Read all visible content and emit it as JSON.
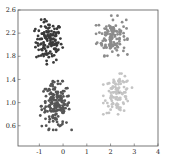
{
  "chart_data": {
    "type": "scatter",
    "title": "",
    "xlabel": "",
    "ylabel": "",
    "xlim": [
      -1.9,
      4.0
    ],
    "ylim": [
      0.25,
      2.6
    ],
    "grid": false,
    "legend": null,
    "x_ticks": [
      -1,
      0,
      1,
      2,
      3,
      4
    ],
    "x_tick_labels": [
      "-1",
      "0",
      "1",
      "2",
      "3",
      "4"
    ],
    "y_ticks": [
      0.6,
      1.0,
      1.4,
      1.8,
      2.2,
      2.6
    ],
    "y_tick_labels": [
      "0.6",
      "1.0",
      "1.4",
      "1.8",
      "2.2",
      "2.6"
    ],
    "series": [
      {
        "name": "cluster-top-left",
        "color": "#3a3a3a",
        "center": [
          -0.6,
          2.05
        ],
        "spread": [
          0.55,
          0.22
        ],
        "count": 130
      },
      {
        "name": "cluster-top-right",
        "color": "#8c8c8c",
        "center": [
          2.05,
          2.15
        ],
        "spread": [
          0.6,
          0.2
        ],
        "count": 120
      },
      {
        "name": "cluster-bottom-left",
        "color": "#555555",
        "center": [
          -0.3,
          0.95
        ],
        "spread": [
          0.6,
          0.24
        ],
        "count": 170
      },
      {
        "name": "cluster-bottom-right",
        "color": "#c4c4c4",
        "center": [
          2.3,
          1.15
        ],
        "spread": [
          0.55,
          0.2
        ],
        "count": 100
      }
    ],
    "annotations": [
      {
        "type": "marker",
        "symbol": "+",
        "x": 2.4,
        "y": 1.18,
        "color": "#999999"
      }
    ]
  },
  "frame": {
    "left": 18,
    "right": 158,
    "top": 10,
    "bottom": 146
  }
}
